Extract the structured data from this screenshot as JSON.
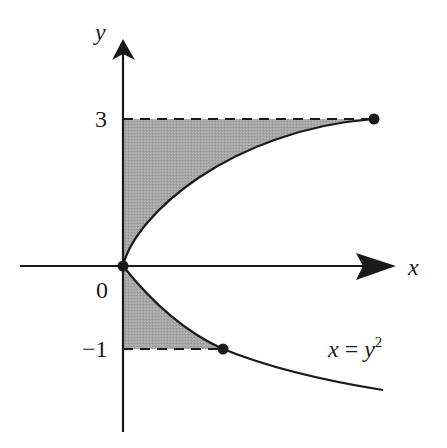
{
  "figure": {
    "type": "region-between-curve-and-axis",
    "curve_equation": "x = y^2",
    "axes": {
      "x_label": "x",
      "y_label": "y",
      "origin_label": "0"
    },
    "y_ticks": [
      {
        "value": 3,
        "label": "3"
      },
      {
        "value": -1,
        "label": "-1",
        "display": "−1"
      }
    ],
    "curve_label": {
      "lhs": "x",
      "eq": " = ",
      "base": "y",
      "exponent": "2"
    },
    "points": [
      {
        "name": "origin",
        "x": 0,
        "y": 0
      },
      {
        "name": "top-endpoint",
        "x": 9,
        "y": 3
      },
      {
        "name": "bottom-endpoint",
        "x": 1,
        "y": -1
      }
    ],
    "shaded_regions": [
      {
        "description": "between y-axis and curve x=y^2 for 0<=y<=3",
        "y_range": [
          0,
          3
        ]
      },
      {
        "description": "between y-axis and curve x=y^2 for -1<=y<=0",
        "y_range": [
          -1,
          0
        ]
      }
    ],
    "dashed_lines": [
      {
        "y": 3,
        "from_x": 0,
        "to_x": 9
      },
      {
        "y": -1,
        "from_x": 0,
        "to_x": 1
      }
    ],
    "colors": {
      "ink": "#1a1a1a",
      "shade": "#a9a9a9",
      "background": "#ffffff"
    }
  }
}
